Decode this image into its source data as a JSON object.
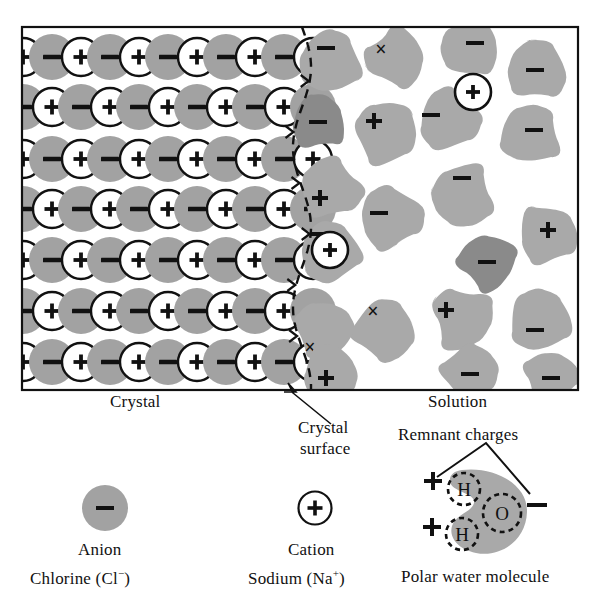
{
  "figure": {
    "frame": {
      "x": 22,
      "y": 27,
      "width": 556,
      "height": 363
    }
  },
  "colors": {
    "water_blob": "#a9a9a9",
    "anion_solvated": "#8a8a8a",
    "anion_crystal": "#a2a2a2",
    "ink": "#111111",
    "background": "#ffffff"
  },
  "regions": {
    "crystal_label": "Crystal",
    "crystal_surface_line1": "Crystal",
    "crystal_surface_line2": "surface",
    "solution_label": "Solution",
    "remnant_charges_label": "Remnant charges"
  },
  "legend": [
    {
      "key": "anion",
      "name": "Anion",
      "species": "Chlorine (Cl",
      "charge": "−",
      "species_tail": ")",
      "symbol": "−",
      "style": "filled-gray-circle"
    },
    {
      "key": "cation",
      "name": "Cation",
      "species": "Sodium (Na",
      "charge": "+",
      "species_tail": ")",
      "symbol": "+",
      "style": "open-circle"
    },
    {
      "key": "water",
      "name": "Polar water molecule",
      "atoms": [
        "H",
        "H",
        "O"
      ],
      "charges": [
        "+",
        "+",
        "−"
      ],
      "style": "gray-blob-with-dashed-atoms"
    }
  ],
  "crystal_lattice": {
    "rows": 7,
    "pattern": "alternating anion/cation checkerboard",
    "anion_symbol": "−",
    "cation_symbol": "+",
    "row_spacing": 52,
    "col_spacing": 58,
    "ion_radius": 23,
    "rows_data": [
      {
        "y": 57,
        "x_start": -6,
        "first": "anion"
      },
      {
        "y": 107,
        "x_start": -35,
        "first": "anion"
      },
      {
        "y": 159,
        "x_start": -6,
        "first": "anion"
      },
      {
        "y": 209,
        "x_start": -35,
        "first": "anion"
      },
      {
        "y": 260,
        "x_start": -6,
        "first": "anion"
      },
      {
        "y": 311,
        "x_start": -35,
        "first": "anion"
      },
      {
        "y": 362,
        "x_start": -6,
        "first": "anion"
      }
    ]
  },
  "solution": {
    "description": "Hydrated ions surrounded by polar water molecules",
    "solvated_cation_symbol": "+",
    "water_marks": [
      "+",
      "−",
      "×"
    ],
    "water_blobs": [
      {
        "cx": 330,
        "cy": 62,
        "r": 34,
        "rot": 20,
        "mark": "−",
        "mx": -4,
        "my": -14
      },
      {
        "cx": 318,
        "cy": 122,
        "r": 30,
        "rot": 200,
        "mark": "−",
        "mx": 0,
        "my": 0,
        "dark": true
      },
      {
        "cx": 395,
        "cy": 58,
        "r": 33,
        "rot": 150,
        "mark": "×",
        "mx": -14,
        "my": -8
      },
      {
        "cx": 470,
        "cy": 48,
        "r": 32,
        "rot": 90,
        "mark": "−",
        "mx": 5,
        "my": -5
      },
      {
        "cx": 537,
        "cy": 70,
        "r": 33,
        "rot": 250,
        "mark": "−",
        "mx": -2,
        "my": 0
      },
      {
        "cx": 330,
        "cy": 188,
        "r": 33,
        "rot": 40,
        "mark": "+",
        "mx": -10,
        "my": 10
      },
      {
        "cx": 386,
        "cy": 133,
        "r": 34,
        "rot": 310,
        "mark": "+",
        "mx": -12,
        "my": -12
      },
      {
        "cx": 449,
        "cy": 120,
        "r": 34,
        "rot": 270,
        "mark": "−",
        "mx": -18,
        "my": -5
      },
      {
        "cx": 530,
        "cy": 135,
        "r": 33,
        "rot": 110,
        "mark": "−",
        "mx": 4,
        "my": -5
      },
      {
        "cx": 462,
        "cy": 196,
        "r": 35,
        "rot": 180,
        "mark": "−",
        "mx": 0,
        "my": -18
      },
      {
        "cx": 391,
        "cy": 218,
        "r": 35,
        "rot": 60,
        "mark": "−",
        "mx": -12,
        "my": -5
      },
      {
        "cx": 330,
        "cy": 252,
        "r": 33,
        "rot": 130,
        "mark": "−",
        "mx": -10,
        "my": -18
      },
      {
        "cx": 487,
        "cy": 262,
        "r": 31,
        "rot": 15,
        "mark": "−",
        "mx": 0,
        "my": 0,
        "dark": true
      },
      {
        "cx": 548,
        "cy": 235,
        "r": 32,
        "rot": 230,
        "mark": "+",
        "mx": 0,
        "my": -5
      },
      {
        "cx": 540,
        "cy": 320,
        "r": 34,
        "rot": 300,
        "mark": "−",
        "mx": -5,
        "my": 10
      },
      {
        "cx": 462,
        "cy": 318,
        "r": 35,
        "rot": 200,
        "mark": "+",
        "mx": -16,
        "my": -8
      },
      {
        "cx": 385,
        "cy": 330,
        "r": 34,
        "rot": 330,
        "mark": "×",
        "mx": -12,
        "my": -18
      },
      {
        "cx": 324,
        "cy": 330,
        "r": 32,
        "rot": 75,
        "mark": "×",
        "mx": -14,
        "my": 18
      },
      {
        "cx": 330,
        "cy": 372,
        "r": 30,
        "rot": 160,
        "mark": "+",
        "mx": -4,
        "my": 6
      },
      {
        "cx": 470,
        "cy": 372,
        "r": 30,
        "rot": 25,
        "mark": "−",
        "mx": 0,
        "my": 2
      },
      {
        "cx": 551,
        "cy": 378,
        "r": 30,
        "rot": 120,
        "mark": "−",
        "mx": 0,
        "my": 0
      }
    ],
    "solvated_cations": [
      {
        "cx": 473,
        "cy": 92,
        "r": 18
      },
      {
        "cx": 330,
        "cy": 250,
        "r": 18
      }
    ]
  },
  "water_molecule_diagram": {
    "atoms": [
      {
        "label": "H",
        "cx": 464,
        "cy": 489,
        "r": 16
      },
      {
        "label": "H",
        "cx": 462,
        "cy": 534,
        "r": 16
      },
      {
        "label": "O",
        "cx": 502,
        "cy": 513,
        "r": 19
      }
    ],
    "charges": [
      {
        "sign": "+",
        "x": 433,
        "y": 481
      },
      {
        "sign": "+",
        "x": 432,
        "y": 527
      },
      {
        "sign": "−",
        "x": 537,
        "y": 505
      }
    ]
  }
}
